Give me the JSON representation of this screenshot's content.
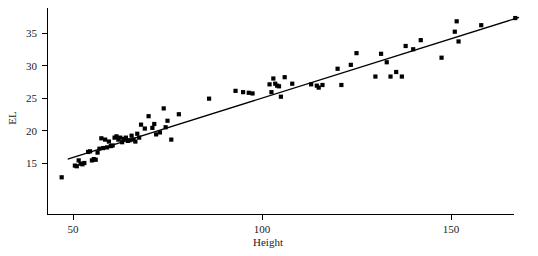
{
  "figure": {
    "background_color": "#ffffff",
    "marker_color": "#000000",
    "line_color": "#000000",
    "axis_color": "#000000"
  },
  "chart_data": {
    "type": "scatter",
    "title": "",
    "xlabel": "Height",
    "ylabel": "EL",
    "xlim": [
      46,
      169
    ],
    "ylim": [
      12.0,
      38.0
    ],
    "grid": false,
    "legend": null,
    "xticks": [
      50,
      100,
      150
    ],
    "xtick_labels": [
      "50",
      "100",
      "150"
    ],
    "yticks": [
      15,
      20,
      25,
      30,
      35
    ],
    "ytick_labels": [
      "15",
      "20",
      "25",
      "30",
      "35"
    ],
    "series": [
      {
        "name": "observations",
        "marker": "square",
        "marker_color": "#000000",
        "x": [
          47.0,
          50.5,
          51.0,
          51.5,
          52.0,
          52.5,
          53.0,
          54.0,
          54.5,
          55.0,
          55.5,
          56.0,
          56.5,
          57.0,
          57.5,
          58.0,
          58.5,
          59.0,
          59.5,
          60.0,
          60.5,
          61.0,
          61.5,
          62.0,
          62.5,
          63.0,
          63.5,
          64.0,
          64.5,
          65.0,
          65.5,
          66.0,
          66.5,
          67.0,
          67.5,
          68.0,
          69.0,
          70.0,
          71.0,
          71.5,
          72.0,
          73.0,
          74.0,
          74.5,
          75.0,
          76.0,
          78.0,
          86.0,
          93.0,
          95.0,
          96.5,
          97.5,
          102.0,
          102.5,
          103.0,
          103.5,
          104.0,
          104.5,
          105.0,
          106.0,
          108.0,
          113.0,
          114.5,
          115.0,
          116.0,
          120.0,
          121.0,
          123.5,
          125.0,
          130.0,
          131.5,
          133.0,
          134.0,
          135.5,
          137.0,
          138.0,
          140.0,
          142.0,
          147.5,
          151.0,
          151.5,
          152.0,
          158.0,
          167.0
        ],
        "y": [
          12.8,
          14.6,
          14.5,
          15.4,
          14.9,
          14.8,
          15.0,
          16.7,
          16.8,
          15.4,
          15.6,
          15.5,
          16.6,
          17.2,
          18.8,
          17.3,
          18.6,
          17.4,
          18.3,
          17.6,
          17.7,
          18.9,
          19.1,
          18.6,
          18.9,
          18.2,
          18.7,
          18.9,
          18.4,
          18.5,
          19.2,
          18.6,
          18.3,
          19.5,
          18.9,
          20.9,
          20.3,
          22.2,
          20.4,
          21.0,
          19.4,
          19.7,
          23.4,
          20.5,
          21.5,
          18.6,
          22.5,
          24.9,
          26.1,
          25.9,
          25.8,
          25.7,
          27.1,
          25.9,
          28.0,
          27.2,
          26.9,
          26.8,
          25.2,
          28.2,
          27.2,
          27.1,
          26.9,
          26.6,
          27.0,
          29.5,
          27.0,
          30.1,
          31.9,
          28.3,
          31.8,
          30.5,
          28.3,
          29.0,
          28.3,
          33.0,
          32.5,
          33.9,
          31.2,
          35.2,
          36.8,
          33.7,
          36.2,
          37.3
        ]
      }
    ],
    "fit_line": {
      "name": "least-squares fit",
      "x0": 48.6,
      "y0": 15.6,
      "x1": 168.0,
      "y1": 37.4,
      "color": "#000000"
    }
  }
}
